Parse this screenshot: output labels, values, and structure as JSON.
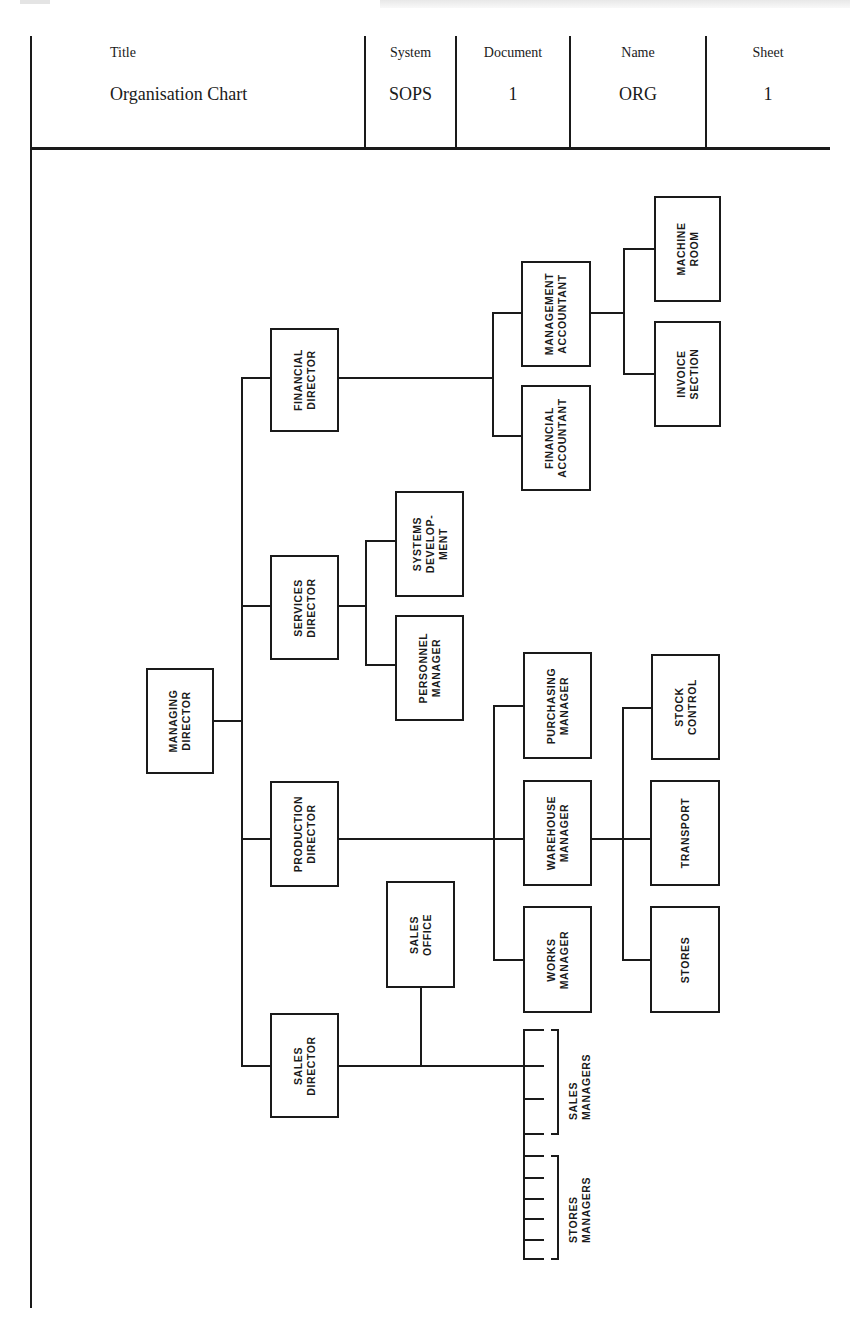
{
  "header": {
    "columns": [
      {
        "label": "Title",
        "value": "Organisation Chart"
      },
      {
        "label": "System",
        "value": "SOPS"
      },
      {
        "label": "Document",
        "value": "1"
      },
      {
        "label": "Name",
        "value": "ORG"
      },
      {
        "label": "Sheet",
        "value": "1"
      }
    ]
  },
  "chart": {
    "root": "MANAGING DIRECTOR",
    "nodes": {
      "managing_director": [
        "MANAGING",
        "DIRECTOR"
      ],
      "financial_director": [
        "FINANCIAL",
        "DIRECTOR"
      ],
      "services_director": [
        "SERVICES",
        "DIRECTOR"
      ],
      "production_director": [
        "PRODUCTION",
        "DIRECTOR"
      ],
      "sales_director": [
        "SALES",
        "DIRECTOR"
      ],
      "management_accountant": [
        "MANAGEMENT",
        "ACCOUNTANT"
      ],
      "financial_accountant": [
        "FINANCIAL",
        "ACCOUNTANT"
      ],
      "machine_room": [
        "MACHINE",
        "ROOM"
      ],
      "invoice_section": [
        "INVOICE",
        "SECTION"
      ],
      "systems_development": [
        "SYSTEMS",
        "DEVELOP-",
        "MENT"
      ],
      "personnel_manager": [
        "PERSONNEL",
        "MANAGER"
      ],
      "purchasing_manager": [
        "PURCHASING",
        "MANAGER"
      ],
      "warehouse_manager": [
        "WAREHOUSE",
        "MANAGER"
      ],
      "works_manager": [
        "WORKS",
        "MANAGER"
      ],
      "stock_control": [
        "STOCK",
        "CONTROL"
      ],
      "transport": [
        "TRANSPORT"
      ],
      "stores": [
        "STORES"
      ],
      "sales_office": [
        "SALES",
        "OFFICE"
      ]
    },
    "group_labels": {
      "sales_managers": [
        "SALES",
        "MANAGERS"
      ],
      "stores_managers": [
        "STORES",
        "MANAGERS"
      ]
    },
    "hierarchy": [
      {
        "parent": "MANAGING DIRECTOR",
        "children": [
          "FINANCIAL DIRECTOR",
          "SERVICES DIRECTOR",
          "PRODUCTION DIRECTOR",
          "SALES DIRECTOR"
        ]
      },
      {
        "parent": "FINANCIAL DIRECTOR",
        "children": [
          "MANAGEMENT ACCOUNTANT",
          "FINANCIAL ACCOUNTANT"
        ]
      },
      {
        "parent": "MANAGEMENT ACCOUNTANT",
        "children": [
          "MACHINE ROOM",
          "INVOICE SECTION"
        ]
      },
      {
        "parent": "SERVICES DIRECTOR",
        "children": [
          "SYSTEMS DEVELOPMENT",
          "PERSONNEL MANAGER"
        ]
      },
      {
        "parent": "PRODUCTION DIRECTOR",
        "children": [
          "PURCHASING MANAGER",
          "WAREHOUSE MANAGER",
          "WORKS MANAGER"
        ]
      },
      {
        "parent": "WAREHOUSE MANAGER",
        "children": [
          "STOCK CONTROL",
          "TRANSPORT",
          "STORES"
        ]
      },
      {
        "parent": "SALES DIRECTOR",
        "children": [
          "SALES OFFICE",
          "SALES MANAGERS",
          "STORES MANAGERS"
        ]
      }
    ]
  }
}
